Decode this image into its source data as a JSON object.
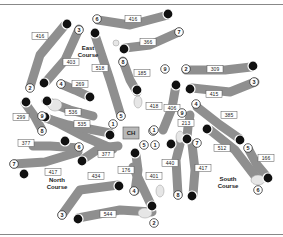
{
  "map": {
    "clubhouse": {
      "label": "CH",
      "x": 131,
      "y": 133
    },
    "courses": [
      {
        "name_line1": "East",
        "name_line2": "Course",
        "x": 88,
        "y": 50
      },
      {
        "name_line1": "North",
        "name_line2": "Course",
        "x": 57,
        "y": 182
      },
      {
        "name_line1": "South",
        "name_line2": "Course",
        "x": 228,
        "y": 181
      }
    ],
    "holes": [
      {
        "course": "East",
        "number": "1",
        "yardage": "535",
        "tee": [
          113,
          149
        ],
        "green": [
          110,
          160
        ],
        "path": [
          [
            113,
            149
          ],
          [
            85,
            137
          ],
          [
            60,
            124
          ],
          [
            45,
            117
          ]
        ],
        "label": [
          77,
          133
        ],
        "tee_label_pos": [
          113,
          149
        ],
        "green_pos": [
          45,
          117
        ]
      },
      {
        "course": "East",
        "number": "2",
        "yardage": "416",
        "path": [
          [
            30,
            87
          ],
          [
            40,
            55
          ],
          [
            65,
            25
          ]
        ],
        "label": [
          40,
          36
        ],
        "tee_label_pos": [
          30,
          88
        ],
        "green_pos": [
          67,
          24
        ]
      },
      {
        "course": "East",
        "number": "3",
        "yardage": "403",
        "path": [
          [
            79,
            29
          ],
          [
            65,
            60
          ],
          [
            45,
            83
          ]
        ],
        "label": [
          69,
          62
        ],
        "tee_label_pos": [
          79,
          29
        ],
        "green_pos": [
          44,
          83
        ]
      },
      {
        "course": "East",
        "number": "4",
        "yardage": "269",
        "path": [
          [
            61,
            84
          ],
          [
            75,
            90
          ],
          [
            90,
            97
          ]
        ],
        "label": [
          79,
          83
        ],
        "tee_label_pos": [
          61,
          84
        ],
        "green_pos": [
          90,
          97
        ]
      },
      {
        "course": "East",
        "number": "5",
        "yardage": "518",
        "path": [
          [
            121,
            116
          ],
          [
            110,
            80
          ],
          [
            95,
            35
          ]
        ],
        "label": [
          101,
          70
        ],
        "tee_label_pos": [
          121,
          116
        ],
        "green_pos": [
          95,
          33
        ]
      },
      {
        "course": "East",
        "number": "6",
        "yardage": "416",
        "path": [
          [
            98,
            20
          ],
          [
            130,
            25
          ],
          [
            168,
            15
          ]
        ],
        "label": [
          131,
          19
        ],
        "tee_label_pos": [
          96,
          19
        ],
        "green_pos": [
          168,
          14
        ]
      },
      {
        "course": "East",
        "number": "7",
        "yardage": "366",
        "path": [
          [
            179,
            32
          ],
          [
            150,
            45
          ],
          [
            125,
            48
          ]
        ],
        "label": [
          149,
          42
        ],
        "tee_label_pos": [
          179,
          32
        ],
        "green_pos": [
          124,
          49
        ]
      },
      {
        "course": "East",
        "number": "8",
        "yardage": "185",
        "path": [
          [
            123,
            61
          ],
          [
            130,
            80
          ],
          [
            137,
            92
          ]
        ],
        "label": [
          141,
          73
        ],
        "tee_label_pos": [
          123,
          61
        ],
        "green_pos": [
          137,
          90
        ]
      },
      {
        "course": "East",
        "number": "9",
        "yardage": "538",
        "path": [
          [
            46,
            101
          ],
          [
            70,
            110
          ],
          [
            93,
            116
          ]
        ],
        "label": [
          73,
          112
        ],
        "tee_label_pos": [
          42,
          104
        ],
        "green_pos": [
          47,
          101
        ]
      },
      {
        "course": "North",
        "number": "1",
        "yardage": "401",
        "path": [
          [
            133,
            167
          ],
          [
            144,
            190
          ],
          [
            152,
            207
          ]
        ],
        "label": [
          152,
          192
        ],
        "tee_label_pos": [
          151,
          174
        ],
        "green_pos": [
          152,
          206
        ]
      },
      {
        "course": "North",
        "number": "2",
        "yardage": "544",
        "path": [
          [
            152,
            212
          ],
          [
            120,
            210
          ],
          [
            78,
            218
          ]
        ],
        "label": [
          113,
          213
        ],
        "tee_label_pos": [
          155,
          222
        ],
        "green_pos": [
          78,
          219
        ]
      },
      {
        "course": "North",
        "number": "3",
        "yardage": "434",
        "path": [
          [
            62,
            215
          ],
          [
            80,
            190
          ],
          [
            118,
            185
          ]
        ],
        "label": [
          95,
          187
        ],
        "tee_label_pos": [
          62,
          215
        ],
        "green_pos": [
          119,
          186
        ]
      },
      {
        "course": "North",
        "number": "4",
        "yardage": "176",
        "path": [
          [
            135,
            191
          ],
          [
            138,
            170
          ],
          [
            136,
            155
          ]
        ],
        "label": [
          126,
          170
        ],
        "tee_label_pos": [
          134,
          191
        ],
        "green_pos": [
          135,
          153
        ]
      },
      {
        "course": "North",
        "number": "5",
        "yardage": "377",
        "path": [
          [
            118,
            146
          ],
          [
            100,
            148
          ],
          [
            82,
            160
          ]
        ],
        "label": [
          106,
          154
        ],
        "tee_label_pos": [
          118,
          146
        ],
        "green_pos": [
          82,
          161
        ]
      },
      {
        "course": "North",
        "number": "6",
        "yardage": "377",
        "path": [
          [
            79,
            148
          ],
          [
            50,
            146
          ],
          [
            33,
            146
          ]
        ],
        "label": [
          26,
          144
        ],
        "tee_label_pos": [
          79,
          148
        ],
        "green_pos": [
          65,
          141
        ]
      },
      {
        "course": "North",
        "number": "7",
        "yardage": "417",
        "path": [
          [
            14,
            164
          ],
          [
            45,
            162
          ],
          [
            78,
            152
          ]
        ],
        "label": [
          53,
          170
        ],
        "tee_label_pos": [
          14,
          164
        ],
        "green_pos": [
          24,
          174
        ]
      },
      {
        "course": "North",
        "number": "8",
        "yardage": "299",
        "path": [
          [
            42,
            130
          ],
          [
            35,
            117
          ],
          [
            25,
            103
          ]
        ],
        "label": [
          22,
          118
        ],
        "tee_label_pos": [
          42,
          132
        ],
        "green_pos": [
          26,
          102
        ]
      },
      {
        "course": "North",
        "number": "9",
        "yardage": "535",
        "path": [
          [
            42,
            117
          ],
          [
            68,
            125
          ],
          [
            110,
            133
          ]
        ],
        "label": [
          81,
          124
        ],
        "tee_label_pos": [
          42,
          117
        ],
        "green_pos": [
          110,
          135
        ]
      },
      {
        "course": "South",
        "number": "1",
        "yardage": "406",
        "path": [
          [
            163,
            130
          ],
          [
            172,
            108
          ],
          [
            176,
            85
          ]
        ],
        "label": [
          175,
          110
        ],
        "tee_label_pos": [
          163,
          130
        ],
        "green_pos": [
          176,
          85
        ]
      },
      {
        "course": "South",
        "number": "2",
        "yardage": "309",
        "path": [
          [
            186,
            70
          ],
          [
            225,
            70
          ],
          [
            251,
            67
          ]
        ],
        "label": [
          217,
          70
        ],
        "tee_label_pos": [
          186,
          70
        ],
        "green_pos": [
          253,
          66
        ]
      },
      {
        "course": "South",
        "number": "3",
        "yardage": "415",
        "path": [
          [
            255,
            82
          ],
          [
            230,
            92
          ],
          [
            192,
            88
          ]
        ],
        "label": [
          216,
          94
        ],
        "tee_label_pos": [
          255,
          82
        ],
        "green_pos": [
          190,
          89
        ]
      },
      {
        "course": "South",
        "number": "4",
        "yardage": "385",
        "path": [
          [
            197,
            107
          ],
          [
            220,
            125
          ],
          [
            240,
            139
          ]
        ],
        "label": [
          229,
          116
        ],
        "tee_label_pos": [
          197,
          107
        ],
        "green_pos": [
          240,
          140
        ]
      },
      {
        "course": "South",
        "number": "5",
        "yardage": "166",
        "path": [
          [
            249,
            150
          ],
          [
            257,
            165
          ],
          [
            267,
            177
          ]
        ],
        "label": [
          264,
          160
        ],
        "tee_label_pos": [
          249,
          150
        ],
        "green_pos": [
          268,
          178
        ]
      },
      {
        "course": "South",
        "number": "6",
        "yardage": "213",
        "path": [
          [
            190,
            115
          ],
          [
            188,
            127
          ],
          [
            187,
            137
          ]
        ],
        "label": [
          182,
          124
        ],
        "tee_label_pos": [
          188,
          112
        ],
        "green_pos": [
          187,
          139
        ]
      },
      {
        "course": "South",
        "number": "7",
        "yardage": "512",
        "path": [
          [
            210,
            130
          ],
          [
            235,
            150
          ],
          [
            258,
            180
          ]
        ],
        "label": [
          222,
          148
        ],
        "tee_label_pos": [
          197,
          142
        ],
        "green_pos": [
          207,
          129
        ]
      },
      {
        "course": "South",
        "number": "8",
        "yardage": "440",
        "path": [
          [
            178,
            195
          ],
          [
            176,
            160
          ],
          [
            181,
            140
          ]
        ],
        "label": [
          171,
          164
        ],
        "tee_label_pos": [
          177,
          196
        ],
        "green_pos": [
          171,
          144
        ]
      },
      {
        "course": "South",
        "number": "9",
        "yardage": "417",
        "path": [
          [
            192,
            144
          ],
          [
            195,
            170
          ],
          [
            193,
            195
          ]
        ],
        "label": [
          201,
          170
        ],
        "tee_label_pos": [
          193,
          143
        ],
        "green_pos": [
          192,
          196
        ]
      }
    ]
  },
  "labels": {
    "yardages": [
      {
        "text": "416",
        "x": 40,
        "y": 36
      },
      {
        "text": "403",
        "x": 71,
        "y": 62
      },
      {
        "text": "269",
        "x": 80,
        "y": 84
      },
      {
        "text": "518",
        "x": 100,
        "y": 68
      },
      {
        "text": "416",
        "x": 133,
        "y": 19
      },
      {
        "text": "366",
        "x": 148,
        "y": 42
      },
      {
        "text": "185",
        "x": 142,
        "y": 73
      },
      {
        "text": "536",
        "x": 73,
        "y": 112
      },
      {
        "text": "535",
        "x": 82,
        "y": 124
      },
      {
        "text": "299",
        "x": 21,
        "y": 117
      },
      {
        "text": "377",
        "x": 26,
        "y": 143
      },
      {
        "text": "377",
        "x": 106,
        "y": 154
      },
      {
        "text": "417",
        "x": 53,
        "y": 172
      },
      {
        "text": "434",
        "x": 96,
        "y": 176
      },
      {
        "text": "176",
        "x": 126,
        "y": 170
      },
      {
        "text": "544",
        "x": 108,
        "y": 214
      },
      {
        "text": "401",
        "x": 154,
        "y": 176
      },
      {
        "text": "418",
        "x": 154,
        "y": 106
      },
      {
        "text": "406",
        "x": 172,
        "y": 108
      },
      {
        "text": "213",
        "x": 186,
        "y": 123
      },
      {
        "text": "309",
        "x": 215,
        "y": 69
      },
      {
        "text": "415",
        "x": 214,
        "y": 94
      },
      {
        "text": "385",
        "x": 229,
        "y": 115
      },
      {
        "text": "512",
        "x": 222,
        "y": 148
      },
      {
        "text": "166",
        "x": 266,
        "y": 158
      },
      {
        "text": "440",
        "x": 170,
        "y": 163
      },
      {
        "text": "417",
        "x": 203,
        "y": 168
      }
    ],
    "tee_numbers": [
      {
        "text": "6",
        "x": 97,
        "y": 19
      },
      {
        "text": "7",
        "x": 179,
        "y": 32
      },
      {
        "text": "3",
        "x": 79,
        "y": 30
      },
      {
        "text": "2",
        "x": 30,
        "y": 88
      },
      {
        "text": "4",
        "x": 61,
        "y": 84
      },
      {
        "text": "8",
        "x": 123,
        "y": 62
      },
      {
        "text": "9",
        "x": 165,
        "y": 69
      },
      {
        "text": "2",
        "x": 186,
        "y": 69
      },
      {
        "text": "3",
        "x": 254,
        "y": 82
      },
      {
        "text": "4",
        "x": 196,
        "y": 104
      },
      {
        "text": "9",
        "x": 182,
        "y": 113
      },
      {
        "text": "5",
        "x": 121,
        "y": 116
      },
      {
        "text": "9",
        "x": 42,
        "y": 116
      },
      {
        "text": "1",
        "x": 113,
        "y": 124
      },
      {
        "text": "8",
        "x": 42,
        "y": 131
      },
      {
        "text": "1",
        "x": 153,
        "y": 131
      },
      {
        "text": "1",
        "x": 154,
        "y": 130
      },
      {
        "text": "5",
        "x": 144,
        "y": 145
      },
      {
        "text": "1",
        "x": 155,
        "y": 145
      },
      {
        "text": "7",
        "x": 197,
        "y": 143
      },
      {
        "text": "6",
        "x": 79,
        "y": 147
      },
      {
        "text": "5",
        "x": 248,
        "y": 148
      },
      {
        "text": "7",
        "x": 14,
        "y": 164
      },
      {
        "text": "4",
        "x": 134,
        "y": 191
      },
      {
        "text": "8",
        "x": 178,
        "y": 195
      },
      {
        "text": "6",
        "x": 258,
        "y": 190
      },
      {
        "text": "3",
        "x": 62,
        "y": 215
      },
      {
        "text": "2",
        "x": 154,
        "y": 223
      }
    ]
  }
}
